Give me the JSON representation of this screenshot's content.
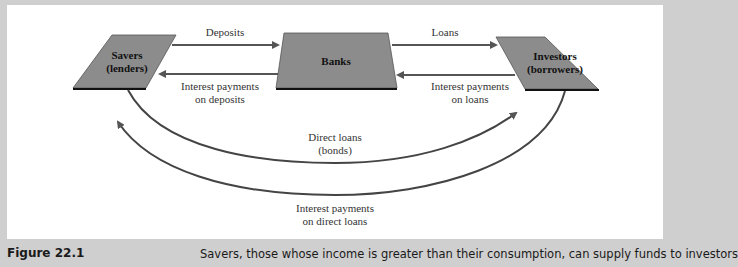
{
  "diagram": {
    "nodes": {
      "savers": {
        "line1": "Savers",
        "line2": "(lenders)"
      },
      "banks": {
        "label": "Banks"
      },
      "investors": {
        "line1": "Investors",
        "line2": "(borrowers)"
      }
    },
    "flows": {
      "deposits": "Deposits",
      "interest_deposits_1": "Interest payments",
      "interest_deposits_2": "on deposits",
      "loans": "Loans",
      "interest_loans_1": "Interest payments",
      "interest_loans_2": "on loans",
      "direct_loans_1": "Direct loans",
      "direct_loans_2": "(bonds)",
      "interest_direct_1": "Interest payments",
      "interest_direct_2": "on direct loans"
    },
    "colors": {
      "node_fill": "#8c8c8c",
      "arrow": "#555555",
      "background": "#cfcfcf"
    }
  },
  "caption": {
    "figure_number": "Figure 22.1",
    "text": "Savers, those whose income is greater than their consumption, can supply funds to investors"
  }
}
